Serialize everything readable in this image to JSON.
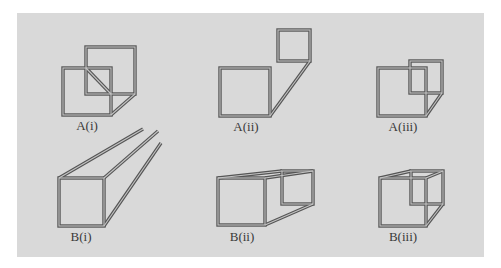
{
  "figure": {
    "background_color": "#d9d9d9",
    "stroke_color": "#5a5a5a",
    "highlight_color": "#bdbdbd",
    "panels": [
      {
        "id": "A(i)",
        "label": "A(i)"
      },
      {
        "id": "A(ii)",
        "label": "A(ii)"
      },
      {
        "id": "A(iii)",
        "label": "A(iii)"
      },
      {
        "id": "B(i)",
        "label": "B(i)"
      },
      {
        "id": "B(ii)",
        "label": "B(ii)"
      },
      {
        "id": "B(iii)",
        "label": "B(iii)"
      }
    ]
  }
}
